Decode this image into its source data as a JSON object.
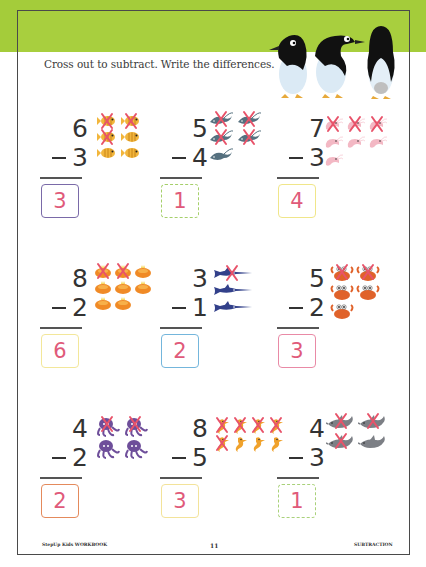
{
  "instruction": "Cross out to subtract. Write the differences.",
  "colors": {
    "header_band": "#a4cc3a",
    "frame_border": "#4a4a4a",
    "answer_text": "#e05a7a",
    "cross_mark": "#e8536a"
  },
  "problems": [
    {
      "minuend": "6",
      "subtrahend": "3",
      "difference": "3",
      "picture": "fish-icon",
      "count": 6,
      "crossed": 3,
      "box_color": "#7a6aa8",
      "dashed": false
    },
    {
      "minuend": "5",
      "subtrahend": "4",
      "difference": "1",
      "picture": "stingray-icon",
      "count": 5,
      "crossed": 4,
      "box_color": "#a5cf6a",
      "dashed": true
    },
    {
      "minuend": "7",
      "subtrahend": "3",
      "difference": "4",
      "picture": "shrimp-icon",
      "count": 7,
      "crossed": 3,
      "box_color": "#f0e68a",
      "dashed": false
    },
    {
      "minuend": "8",
      "subtrahend": "2",
      "difference": "6",
      "picture": "sea-urchin-icon",
      "count": 8,
      "crossed": 2,
      "box_color": "#f3e79a",
      "dashed": false
    },
    {
      "minuend": "3",
      "subtrahend": "1",
      "difference": "2",
      "picture": "swordfish-icon",
      "count": 3,
      "crossed": 1,
      "box_color": "#74b6dc",
      "dashed": false
    },
    {
      "minuend": "5",
      "subtrahend": "2",
      "difference": "3",
      "picture": "crab-icon",
      "count": 5,
      "crossed": 2,
      "box_color": "#e98aa6",
      "dashed": false
    },
    {
      "minuend": "4",
      "subtrahend": "2",
      "difference": "2",
      "picture": "octopus-icon",
      "count": 4,
      "crossed": 2,
      "box_color": "#e48a5c",
      "dashed": false
    },
    {
      "minuend": "8",
      "subtrahend": "5",
      "difference": "3",
      "picture": "seahorse-icon",
      "count": 8,
      "crossed": 5,
      "box_color": "#f3e39a",
      "dashed": false
    },
    {
      "minuend": "4",
      "subtrahend": "3",
      "difference": "1",
      "picture": "dolphin-icon",
      "count": 4,
      "crossed": 3,
      "box_color": "#a9d17a",
      "dashed": true
    }
  ],
  "footer": {
    "left": "StepUp Kids WORKBOOK",
    "page_number": "11",
    "right": "SUBTRACTION"
  }
}
